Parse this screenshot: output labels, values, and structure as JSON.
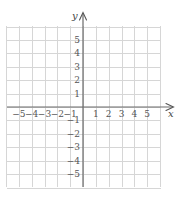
{
  "chart_data": {
    "type": "scatter",
    "title": "",
    "xlabel": "x",
    "ylabel": "y",
    "xlim": [
      -6,
      6
    ],
    "ylim": [
      -6,
      6
    ],
    "grid": true,
    "x_ticks": [
      -5,
      -4,
      -3,
      -2,
      -1,
      1,
      2,
      3,
      4,
      5
    ],
    "y_ticks": [
      5,
      4,
      3,
      2,
      1,
      -1,
      -2,
      -3,
      -4,
      -5
    ],
    "x_tick_labels": [
      "−5",
      "−4",
      "−3",
      "−2",
      "−1",
      "1",
      "2",
      "3",
      "4",
      "5"
    ],
    "y_tick_labels": [
      "5",
      "4",
      "3",
      "2",
      "1",
      "−1",
      "−2",
      "−3",
      "−4",
      "−5"
    ],
    "series": [],
    "legend": null
  },
  "colors": {
    "grid": "#d6d6d6",
    "axis": "#6a6a6a",
    "text": "#555555"
  }
}
